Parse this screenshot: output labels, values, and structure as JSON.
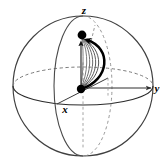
{
  "figure": {
    "background_color": "#ffffff",
    "width": 167,
    "height": 163
  },
  "sphere": {
    "center_x": 83,
    "center_y": 86,
    "radius_x": 70,
    "radius_y": 70,
    "outline_color": "#3a3a3a",
    "equator_front_color": "#2e2e2e",
    "equator_back_color": "#6f6f6f",
    "meridian_color": "#4a4a4a",
    "meridian_hidden_color": "#8a8a8a"
  },
  "axes": [
    {
      "name": "z-axis",
      "label": "z",
      "label_x": 84,
      "label_y": 13,
      "direction": "up",
      "style": "dashed-hidden-solid-visible"
    },
    {
      "name": "x-axis",
      "label": "x",
      "label_x": 65,
      "label_y": 111,
      "direction": "front-left-down",
      "style": "solid"
    },
    {
      "name": "y-axis",
      "label": "y",
      "label_x": 157,
      "label_y": 91,
      "direction": "right",
      "style": "solid-with-arrow"
    }
  ],
  "points": [
    {
      "name": "origin-state-point",
      "description": "initial state marker at sphere center / equator start",
      "x": 81,
      "y": 88,
      "radius": 4.2,
      "color": "#000000"
    },
    {
      "name": "target-state-point",
      "description": "final state marker near the north pole",
      "x": 82,
      "y": 35,
      "radius": 4.4,
      "color": "#000000"
    }
  ],
  "trajectories": {
    "count": 7,
    "description": "bundle of geodesic-like arcs from the lower state point to the upper state point, widening to the right",
    "thin_color": "#6b6b6b",
    "thin_width": 0.9,
    "highlight_color": "#000000",
    "highlight_width": 2.4,
    "bulge_offsets": [
      2,
      7,
      12,
      17,
      22,
      28,
      34
    ]
  },
  "arrows": [
    {
      "name": "trajectory-arrowhead",
      "description": "arrowhead of the thick highlighted path arriving at the upper point",
      "x": 86,
      "y": 40,
      "color": "#000000"
    },
    {
      "name": "vertical-arrowhead",
      "description": "small arrowhead on the straight vertical path pointing up to the upper point",
      "x": 81,
      "y": 42,
      "color": "#000000"
    },
    {
      "name": "y-axis-arrowhead",
      "x": 152,
      "y": 88,
      "color": "#2e2e2e"
    }
  ]
}
